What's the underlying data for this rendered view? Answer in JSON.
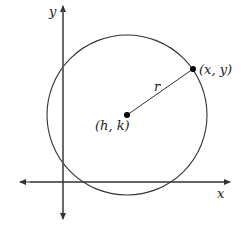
{
  "diagram": {
    "title": "",
    "type": "circle-on-coordinate-plane",
    "axes": {
      "x_label": "x",
      "y_label": "y"
    },
    "circle": {
      "center_label": "(h, k)",
      "point_label": "(x, y)",
      "radius_label": "r"
    },
    "colors": {
      "axis": "#555555",
      "circle": "#333333",
      "text": "#222222",
      "point": "#000000"
    }
  }
}
